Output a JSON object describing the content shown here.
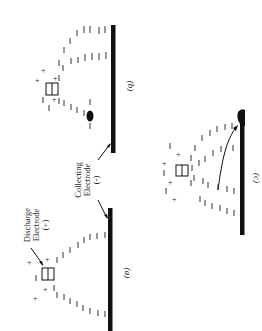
{
  "figure": {
    "panels": [
      {
        "id": "a",
        "label": "(a)"
      },
      {
        "id": "b",
        "label": "(b)"
      },
      {
        "id": "c",
        "label": "(c)"
      }
    ],
    "annotations": {
      "discharge": {
        "line1": "Discharge",
        "line2": "Electrode",
        "line3": "(+)"
      },
      "collecting": {
        "line1": "Collecting",
        "line2": "Electrode",
        "line3": "(-)"
      }
    },
    "symbols": {
      "positive_ion": "+",
      "negative_ion": "−"
    },
    "colors": {
      "ink": "#111111",
      "background": "#ffffff"
    }
  }
}
